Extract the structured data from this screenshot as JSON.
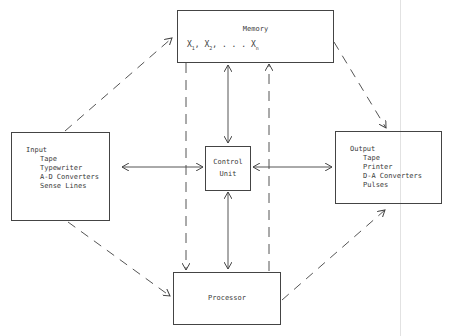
{
  "diagram": {
    "type": "computer-architecture-block-diagram",
    "colors": {
      "line": "#444444",
      "text": "#3a3a3a",
      "background": "#ffffff"
    },
    "nodes": {
      "memory": {
        "title": "Memory",
        "contents": [
          "X1",
          "X2",
          "...",
          "Xn"
        ],
        "contents_label_x": "X",
        "sub1": "1",
        "sub2": "2",
        "subn": "n",
        "ellipsis": ". . ."
      },
      "input": {
        "title": "Input",
        "items": [
          "Tape",
          "Typewriter",
          "A-D Converters",
          "Sense Lines"
        ]
      },
      "control": {
        "line1": "Control",
        "line2": "Unit"
      },
      "output": {
        "title": "Output",
        "items": [
          "Tape",
          "Printer",
          "D-A Converters",
          "Pulses"
        ]
      },
      "processor": {
        "title": "Processor"
      }
    },
    "edges": [
      {
        "from": "input",
        "to": "memory",
        "style": "dashed",
        "arrow": "end"
      },
      {
        "from": "input",
        "to": "processor",
        "style": "dashed",
        "arrow": "end"
      },
      {
        "from": "memory",
        "to": "output",
        "style": "dashed",
        "arrow": "end"
      },
      {
        "from": "processor",
        "to": "output",
        "style": "dashed",
        "arrow": "end"
      },
      {
        "from": "memory",
        "to": "processor",
        "style": "dashed",
        "arrow": "end"
      },
      {
        "from": "processor",
        "to": "memory",
        "style": "dashed",
        "arrow": "end"
      },
      {
        "from": "input",
        "to": "control",
        "style": "solid",
        "arrow": "both"
      },
      {
        "from": "control",
        "to": "output",
        "style": "solid",
        "arrow": "both"
      },
      {
        "from": "memory",
        "to": "control",
        "style": "solid",
        "arrow": "both"
      },
      {
        "from": "control",
        "to": "processor",
        "style": "solid",
        "arrow": "both"
      }
    ]
  }
}
